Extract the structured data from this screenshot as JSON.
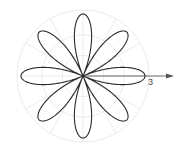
{
  "chart_data": {
    "type": "line",
    "subtype": "polar",
    "title": "",
    "equation": "r = 3 cos(4θ)",
    "petals": 8,
    "rmax": 3,
    "series": [
      {
        "name": "rose",
        "function": "3*cos(4*theta)",
        "theta_range": [
          0,
          6.2832
        ]
      }
    ],
    "grid": {
      "on": true,
      "circles_r": [
        1,
        2,
        3
      ],
      "radial_deg_step": 30
    },
    "axis": {
      "polar_axis_direction": "right",
      "tick_labels": [
        "3"
      ]
    },
    "colors": {
      "curve": "#2a2a2a",
      "grid": "#e6e6e6",
      "axis": "#555555"
    }
  },
  "labels": {
    "axis_tick": "3"
  }
}
